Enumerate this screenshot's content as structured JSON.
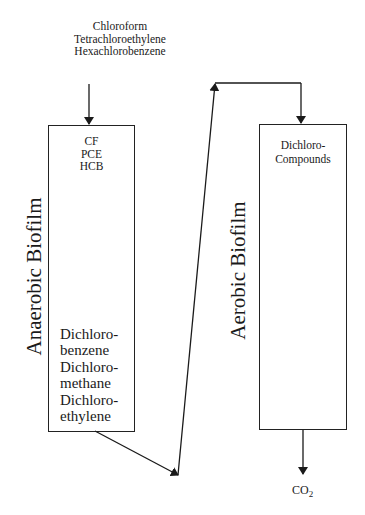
{
  "diagram": {
    "inputs": [
      "Chloroform",
      "Tetrachloroethylene",
      "Hexachlorobenzene"
    ],
    "anaerobic": {
      "label": "Anaerobic Biofilm",
      "top_compounds": [
        "CF",
        "PCE",
        "HCB"
      ],
      "products": [
        "Dichloro-",
        "benzene",
        "Dichloro-",
        "methane",
        "Dichloro-",
        "ethylene"
      ]
    },
    "aerobic": {
      "label": "Aerobic Biofilm",
      "top_compounds": [
        "Dichloro-",
        "Compounds"
      ]
    },
    "output": {
      "main": "CO",
      "subscript": "2"
    },
    "colors": {
      "line": "#1a1a1a",
      "background": "#ffffff"
    }
  }
}
